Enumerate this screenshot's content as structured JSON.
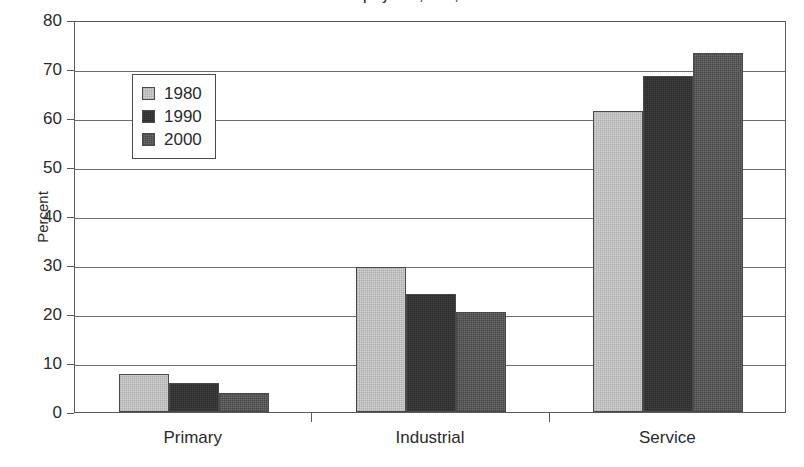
{
  "chart_data": {
    "type": "bar",
    "title": "Share of Total Employment, 1980, 1990 and 2000",
    "xlabel": "",
    "ylabel": "Percent",
    "ylim": [
      0,
      80
    ],
    "ytick_step": 10,
    "yticks": [
      "0",
      "10",
      "20",
      "30",
      "40",
      "50",
      "60",
      "70",
      "80"
    ],
    "grid": true,
    "legend_position": "upper-left-inside",
    "categories": [
      "Primary",
      "Industrial",
      "Service"
    ],
    "series": [
      {
        "name": "1980",
        "color": "#d2d2d2",
        "values": [
          7.7,
          29.5,
          61.5
        ]
      },
      {
        "name": "1990",
        "color": "#2b2b2b",
        "values": [
          6.0,
          24.0,
          68.5
        ]
      },
      {
        "name": "2000",
        "color": "#6b6b6b",
        "values": [
          3.8,
          20.5,
          73.2
        ]
      }
    ]
  },
  "axis": {
    "y_title": "Percent"
  }
}
